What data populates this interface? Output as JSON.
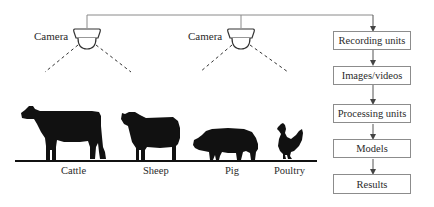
{
  "diagram": {
    "cameras": [
      {
        "label": "Camera"
      },
      {
        "label": "Camera"
      }
    ],
    "animals": [
      {
        "label": "Cattle"
      },
      {
        "label": "Sheep"
      },
      {
        "label": "Pig"
      },
      {
        "label": "Poultry"
      }
    ],
    "flow": {
      "steps": [
        {
          "label": "Recording units"
        },
        {
          "label": "Images/videos"
        },
        {
          "label": "Processing units"
        },
        {
          "label": "Models"
        },
        {
          "label": "Results"
        }
      ]
    },
    "colors": {
      "line": "#7a7a7a",
      "silhouette": "#111111",
      "box_border": "#8c8c8c",
      "text": "#2a2a2a"
    }
  }
}
